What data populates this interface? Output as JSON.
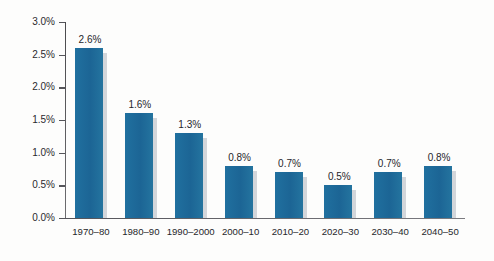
{
  "chart_data": {
    "type": "bar",
    "title": "",
    "xlabel": "",
    "ylabel": "Annual Growth Rate (%)",
    "categories": [
      "1970–80",
      "1980–90",
      "1990–2000",
      "2000–10",
      "2010–20",
      "2020–30",
      "2030–40",
      "2040–50"
    ],
    "values": [
      2.6,
      1.6,
      1.3,
      0.8,
      0.7,
      0.5,
      0.7,
      0.8
    ],
    "data_labels": [
      "2.6%",
      "1.6%",
      "1.3%",
      "0.8%",
      "0.7%",
      "0.5%",
      "0.7%",
      "0.8%"
    ],
    "ylim": [
      0.0,
      3.0
    ],
    "ytick_values": [
      3.0,
      2.5,
      2.0,
      1.5,
      1.0,
      0.5,
      0.0
    ],
    "ytick_labels": [
      "3.0%",
      "2.5%",
      "2.0%",
      "1.5%",
      "1.0%",
      "0.5%",
      "0.0%"
    ],
    "grid": false,
    "legend": false,
    "legend_position": "none",
    "bar_color": "#1f6b9b",
    "bar_shadow_color": "#d3d6da",
    "axis_color": "#55555a",
    "text_color": "#26262b",
    "background_color": "#fdfdfc"
  }
}
